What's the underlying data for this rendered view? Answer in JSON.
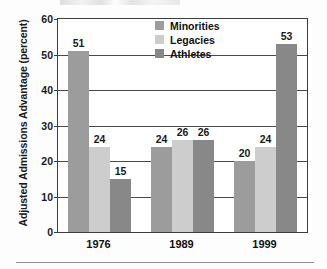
{
  "chart_data": {
    "type": "bar",
    "title": "",
    "xlabel": "",
    "ylabel": "Adjusted Admissions Advantage (percent)",
    "categories": [
      "1976",
      "1989",
      "1999"
    ],
    "series": [
      {
        "name": "Minorities",
        "color": "#9c9c9c",
        "values": [
          51,
          24,
          20
        ]
      },
      {
        "name": "Legacies",
        "color": "#cdcdcd",
        "values": [
          24,
          26,
          24
        ]
      },
      {
        "name": "Athletes",
        "color": "#888888",
        "values": [
          15,
          26,
          53
        ]
      }
    ],
    "ylim": [
      0,
      60
    ],
    "yticks": [
      0,
      10,
      20,
      30,
      40,
      50,
      60
    ],
    "ytick_labels": [
      "0",
      "10",
      "20",
      "30",
      "40",
      "50",
      "60"
    ],
    "grid": true,
    "legend_position": "top-center",
    "value_labels": true
  },
  "legend": {
    "items": [
      {
        "label": "Minorities"
      },
      {
        "label": "Legacies"
      },
      {
        "label": "Athletes"
      }
    ]
  },
  "axis": {
    "y_title": "Adjusted Admissions Advantage (percent)"
  }
}
